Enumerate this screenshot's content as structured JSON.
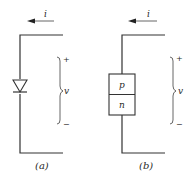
{
  "panels": [
    {
      "id": "a",
      "caption": "(a)",
      "current_label": "i",
      "voltage_label": "v",
      "plus_sign": "+",
      "minus_sign": "−",
      "device": "diode-symbol"
    },
    {
      "id": "b",
      "caption": "(b)",
      "current_label": "i",
      "voltage_label": "v",
      "plus_sign": "+",
      "minus_sign": "−",
      "device": "pn-junction",
      "region_top": "p",
      "region_bottom": "n"
    }
  ],
  "colors": {
    "line": "#333333",
    "text": "#2a2a2a",
    "background": "#ffffff"
  }
}
